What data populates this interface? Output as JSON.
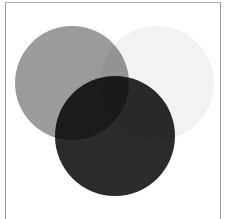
{
  "diagram": {
    "type": "venn",
    "set_count": 3,
    "circles": [
      {
        "id": "left",
        "label": "",
        "cx": 72,
        "cy": 83,
        "r": 57,
        "fill": "#9b9b9b"
      },
      {
        "id": "right",
        "label": "",
        "cx": 157,
        "cy": 83,
        "r": 57,
        "fill": "#f2f2f2"
      },
      {
        "id": "bottom",
        "label": "",
        "cx": 115,
        "cy": 136,
        "r": 60,
        "fill": "#2b2b2b"
      }
    ],
    "frame_color": "#9a9a9a",
    "background": "#ffffff"
  }
}
